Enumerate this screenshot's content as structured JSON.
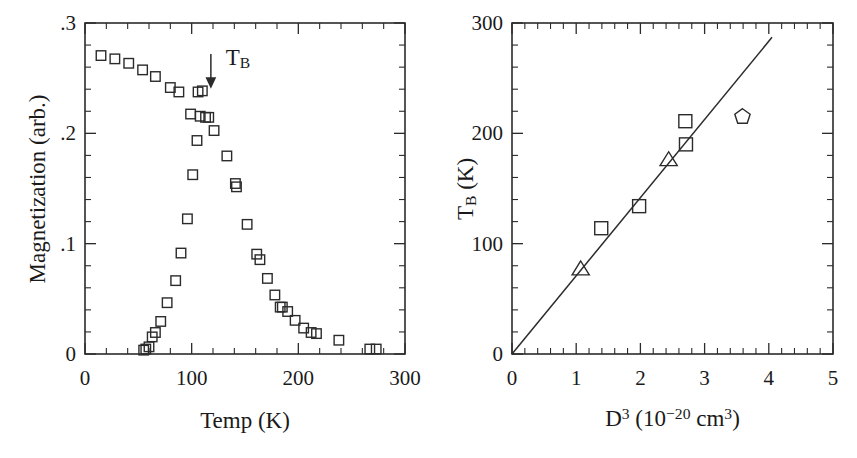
{
  "figure": {
    "background_color": "#ffffff",
    "ink_color": "#2b2b2b",
    "panel_count": 2
  },
  "chart_data": [
    {
      "type": "scatter",
      "panel": "left",
      "title": "",
      "xlabel": "Temp  (K)",
      "ylabel": "Magnetization (arb.)",
      "xlim": [
        0,
        300
      ],
      "ylim": [
        0,
        0.3
      ],
      "xticks": [
        0,
        100,
        200,
        300
      ],
      "xticklabels": [
        "0",
        "100",
        "200",
        "300"
      ],
      "xminor_step": 20,
      "yticks": [
        0,
        0.1,
        0.2,
        0.3
      ],
      "yticklabels": [
        "0",
        ".1",
        ".2",
        ".3"
      ],
      "yminor_step": 0.02,
      "grid": false,
      "legend": "none",
      "annotations": [
        {
          "name": "blocking-temperature-arrow",
          "text": "T_B",
          "text_html": "T<sub>B</sub>",
          "arrow_x": 118,
          "arrow_y_top": 0.272,
          "arrow_y_tip": 0.243,
          "label_x": 132,
          "label_y": 0.268
        }
      ],
      "series": [
        {
          "name": "field-cooled-branch",
          "marker": "square",
          "points": [
            [
              15,
              0.2705
            ],
            [
              28,
              0.2675
            ],
            [
              41,
              0.2635
            ],
            [
              54,
              0.2575
            ],
            [
              66,
              0.2515
            ],
            [
              80,
              0.2415
            ],
            [
              88,
              0.2375
            ],
            [
              99,
              0.2175
            ],
            [
              108,
              0.2155
            ],
            [
              113,
              0.2145
            ],
            [
              116,
              0.2145
            ],
            [
              121,
              0.2025
            ],
            [
              133,
              0.1795
            ],
            [
              141,
              0.1545
            ],
            [
              142,
              0.1515
            ],
            [
              152,
              0.1175
            ],
            [
              161,
              0.0905
            ],
            [
              164,
              0.0855
            ],
            [
              171,
              0.0685
            ],
            [
              178,
              0.0535
            ],
            [
              183,
              0.0425
            ],
            [
              185,
              0.0425
            ],
            [
              190,
              0.0385
            ],
            [
              197,
              0.0305
            ],
            [
              205,
              0.0235
            ],
            [
              212,
              0.0195
            ],
            [
              217,
              0.0185
            ],
            [
              238,
              0.0125
            ],
            [
              267,
              0.0045
            ],
            [
              273,
              0.0045
            ]
          ]
        },
        {
          "name": "zero-field-cooled-branch",
          "marker": "square",
          "points": [
            [
              55,
              0.0035
            ],
            [
              57,
              0.0045
            ],
            [
              60,
              0.0065
            ],
            [
              63,
              0.0155
            ],
            [
              66,
              0.0195
            ],
            [
              71,
              0.0295
            ],
            [
              77,
              0.0465
            ],
            [
              85,
              0.0665
            ],
            [
              90,
              0.0915
            ],
            [
              96,
              0.1225
            ],
            [
              101,
              0.1625
            ],
            [
              105,
              0.1935
            ],
            [
              110,
              0.2385
            ],
            [
              106,
              0.2375
            ]
          ]
        }
      ]
    },
    {
      "type": "scatter",
      "panel": "right",
      "title": "",
      "xlabel": "D^3  (10^-20  cm^3)",
      "xlabel_html": "D<sup>3</sup> (10<sup>&#8722;20</sup> cm<sup>3</sup>)",
      "ylabel": "T_B (K)",
      "ylabel_html": "T<sub>B</sub> (K)",
      "xlim": [
        0,
        5
      ],
      "ylim": [
        0,
        300
      ],
      "xticks": [
        0,
        1,
        2,
        3,
        4,
        5
      ],
      "xticklabels": [
        "0",
        "1",
        "2",
        "3",
        "4",
        "5"
      ],
      "xminor_step": 0.2,
      "yticks": [
        0,
        100,
        200,
        300
      ],
      "yticklabels": [
        "0",
        "100",
        "200",
        "300"
      ],
      "yminor_step": 20,
      "grid": false,
      "legend": "none",
      "fit_line": {
        "name": "linear-fit-line",
        "x_start": 0.0,
        "y_start": 0,
        "x_end": 4.05,
        "y_end": 287
      },
      "series": [
        {
          "name": "square-samples",
          "marker": "square",
          "points": [
            [
              1.39,
              114
            ],
            [
              1.98,
              134
            ],
            [
              2.7,
              211
            ],
            [
              2.71,
              190
            ]
          ]
        },
        {
          "name": "triangle-samples",
          "marker": "triangle",
          "points": [
            [
              1.07,
              77
            ],
            [
              2.44,
              176
            ]
          ]
        },
        {
          "name": "pentagon-sample",
          "marker": "pentagon",
          "points": [
            [
              3.59,
              215
            ]
          ]
        }
      ]
    }
  ]
}
